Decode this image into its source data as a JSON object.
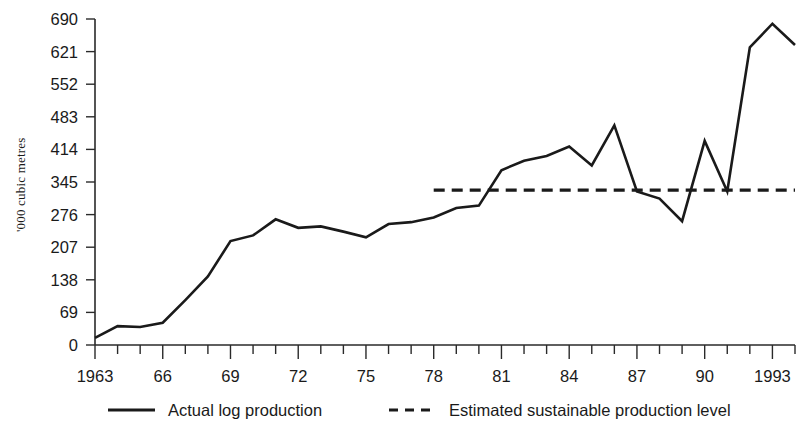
{
  "chart_data": {
    "type": "line",
    "title": "",
    "subtitle": "",
    "xlabel": "",
    "ylabel": "'000 cubic metres",
    "xlim": [
      1963,
      1994
    ],
    "ylim": [
      0,
      690
    ],
    "grid": false,
    "legend_position": "bottom",
    "y_ticks": [
      0,
      69,
      138,
      207,
      276,
      345,
      414,
      483,
      552,
      621,
      690
    ],
    "y_tick_labels": [
      "0",
      "69",
      "138",
      "207",
      "276",
      "345",
      "414",
      "483",
      "552",
      "621",
      "690"
    ],
    "x_ticks": [
      1963,
      1964,
      1965,
      1966,
      1967,
      1968,
      1969,
      1970,
      1971,
      1972,
      1973,
      1974,
      1975,
      1976,
      1977,
      1978,
      1979,
      1980,
      1981,
      1982,
      1983,
      1984,
      1985,
      1986,
      1987,
      1988,
      1989,
      1990,
      1991,
      1992,
      1993,
      1994
    ],
    "x_tick_labels": [
      "1963",
      "",
      "",
      "66",
      "",
      "",
      "69",
      "",
      "",
      "72",
      "",
      "",
      "75",
      "",
      "",
      "78",
      "",
      "",
      "81",
      "",
      "",
      "84",
      "",
      "",
      "87",
      "",
      "",
      "90",
      "",
      "",
      "1993",
      ""
    ],
    "x": [
      1963,
      1964,
      1965,
      1966,
      1967,
      1968,
      1969,
      1970,
      1971,
      1972,
      1973,
      1974,
      1975,
      1976,
      1977,
      1978,
      1979,
      1980,
      1981,
      1982,
      1983,
      1984,
      1985,
      1986,
      1987,
      1988,
      1989,
      1990,
      1991,
      1992,
      1993,
      1994
    ],
    "series": [
      {
        "name": "Actual log production",
        "style": "solid",
        "color": "#1a1a1a",
        "values": [
          15,
          40,
          38,
          47,
          95,
          145,
          220,
          232,
          266,
          248,
          251,
          240,
          228,
          256,
          260,
          270,
          290,
          295,
          370,
          390,
          400,
          420,
          380,
          465,
          325,
          310,
          262,
          432,
          325,
          630,
          680,
          635
        ]
      },
      {
        "name": "Estimated sustainable production level",
        "style": "dashed",
        "color": "#1a1a1a",
        "x_start": 1978,
        "x_end": 1994,
        "value": 328
      }
    ],
    "legend": [
      {
        "label": "Actual log production",
        "style": "solid"
      },
      {
        "label": "Estimated sustainable production level",
        "style": "dashed"
      }
    ]
  }
}
